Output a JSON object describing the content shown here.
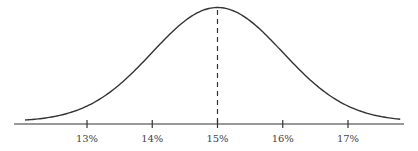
{
  "chart_data": {
    "type": "line",
    "title": "",
    "xlabel": "",
    "ylabel": "",
    "mean": 15,
    "std_dev": 1.0,
    "xlim": [
      11.9,
      17.85
    ],
    "x_ticks": [
      13,
      14,
      15,
      16,
      17
    ],
    "x_tick_labels": [
      "13%",
      "14%",
      "15%",
      "16%",
      "17%"
    ],
    "grid": false,
    "legend": null,
    "series": [
      {
        "name": "probability density",
        "x": [
          12.0,
          12.5,
          13.0,
          13.5,
          14.0,
          14.5,
          15.0,
          15.5,
          16.0,
          16.5,
          17.0,
          17.5,
          17.8
        ],
        "values": [
          0.0044,
          0.0175,
          0.054,
          0.1295,
          0.242,
          0.3521,
          0.3989,
          0.3521,
          0.242,
          0.1295,
          0.054,
          0.0175,
          0.0079
        ]
      }
    ],
    "annotations": [
      {
        "type": "dashed-vertical-line",
        "x": 15
      }
    ],
    "colors": {
      "curve": "#333333",
      "axis": "#333333",
      "mean_line": "#333333"
    }
  }
}
